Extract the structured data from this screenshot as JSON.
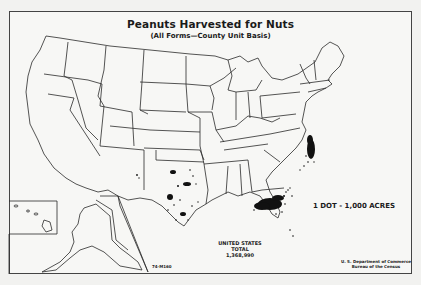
{
  "map": {
    "title": "Peanuts Harvested for Nuts",
    "subtitle": "(All Forms—County Unit Basis)",
    "legend": "1 DOT - 1,000 ACRES",
    "total": {
      "line1": "UNITED STATES",
      "line2": "TOTAL",
      "value": "1,368,990"
    },
    "credit": {
      "line1": "U. S. Department of Commerce",
      "line2": "Bureau of the Census"
    },
    "code": "74-M160",
    "colors": {
      "ink": "#1a1a1a",
      "paper": "#f7f7f5",
      "dots": "#111111"
    },
    "concentrations": [
      {
        "region": "Georgia / Alabama / Florida",
        "density": "very high"
      },
      {
        "region": "North Carolina / Virginia",
        "density": "high"
      },
      {
        "region": "Texas / Oklahoma",
        "density": "moderate"
      },
      {
        "region": "New Mexico",
        "density": "low"
      }
    ]
  }
}
